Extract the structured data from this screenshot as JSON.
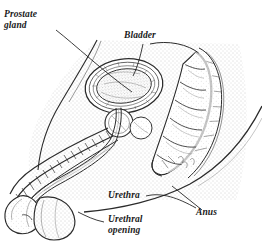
{
  "figure": {
    "style": "pen-and-ink stipple line drawing",
    "background_color": "#ffffff",
    "ink_color": "#1a1a1a",
    "stipple_color": "#8a8a8a"
  },
  "labels": {
    "prostate_gland": "Prostate\ngland",
    "bladder": "Bladder",
    "urethra": "Urethra",
    "urethral_opening": "Urethral\nopening",
    "anus": "Anus"
  },
  "structures": [
    {
      "name": "bladder",
      "description": "oval organ with stippled interior and concentric wall rings"
    },
    {
      "name": "prostate-gland",
      "description": "small circular gland below bladder neck"
    },
    {
      "name": "rectum",
      "description": "segmented curved tube descending at right"
    },
    {
      "name": "penis-shaft",
      "description": "elongated shaft with ladder-like dorsal band"
    },
    {
      "name": "glans",
      "description": "rounded bulb at lower left tip"
    },
    {
      "name": "scrotum",
      "description": "rounded sac behind glans"
    },
    {
      "name": "pubic-bone",
      "description": "stippled wedge above shaft"
    },
    {
      "name": "buttock-outline",
      "description": "large sweeping curve at lower right"
    }
  ]
}
